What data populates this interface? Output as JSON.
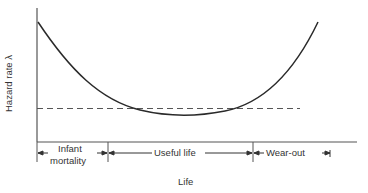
{
  "diagram": {
    "y_axis_label": "Hazard rate λ",
    "x_axis_label": "Life",
    "regions": [
      {
        "label_line1": "Infant",
        "label_line2": "mortality"
      },
      {
        "label": "Useful life"
      },
      {
        "label": "Wear-out"
      }
    ],
    "curve": "bathtub",
    "reference_line": "dashed constant hazard rate",
    "colors": {
      "line": "#2a2a2a",
      "dashed": "#555555",
      "background": "#ffffff"
    }
  }
}
